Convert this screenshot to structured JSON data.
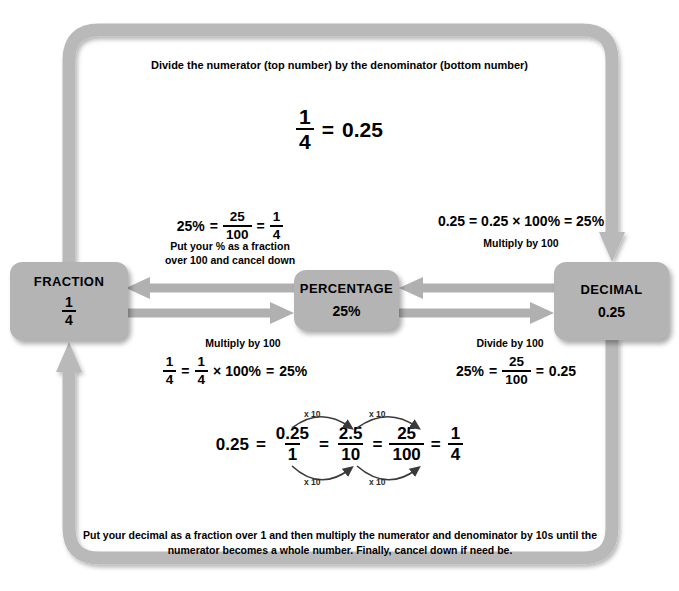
{
  "diagram": {
    "colors": {
      "node_fill": "#b4b4b4",
      "loop": "#b9b9b9",
      "arrow": "#b0b0b0",
      "text": "#000000"
    }
  },
  "top": {
    "caption": "Divide the numerator (top number) by the denominator (bottom number)",
    "equation": {
      "fraction": {
        "numerator": "1",
        "denominator": "4"
      },
      "equals": "=",
      "result": "0.25"
    }
  },
  "nodes": {
    "fraction": {
      "title": "FRACTION",
      "numerator": "1",
      "denominator": "4"
    },
    "percentage": {
      "title": "PERCENTAGE",
      "value": "25%"
    },
    "decimal": {
      "title": "DECIMAL",
      "value": "0.25"
    }
  },
  "percent_to_fraction": {
    "equation": {
      "left": "25%",
      "eq1": "=",
      "frac1": {
        "numerator": "25",
        "denominator": "100"
      },
      "eq2": "=",
      "frac2": {
        "numerator": "1",
        "denominator": "4"
      }
    },
    "caption": "Put your % as a fraction\nover 100 and cancel down"
  },
  "decimal_to_percent": {
    "equation": "0.25 = 0.25 × 100% = 25%",
    "caption": "Multiply by 100"
  },
  "fraction_to_percent": {
    "caption": "Multiply by 100",
    "equation": {
      "frac1": {
        "numerator": "1",
        "denominator": "4"
      },
      "eq1": "=",
      "frac2": {
        "numerator": "1",
        "denominator": "4"
      },
      "times": "× 100%",
      "eq2": "=",
      "result": "25%"
    }
  },
  "percent_to_decimal": {
    "caption": "Divide by 100",
    "equation": {
      "left": "25%",
      "eq1": "=",
      "frac1": {
        "numerator": "25",
        "denominator": "100"
      },
      "eq2": "=",
      "result": "0.25"
    }
  },
  "bottom": {
    "equation": {
      "start": "0.25",
      "eq1": "=",
      "frac1": {
        "numerator": "0.25",
        "denominator": "1"
      },
      "eq2": "=",
      "frac2": {
        "numerator": "2.5",
        "denominator": "10"
      },
      "eq3": "=",
      "frac3": {
        "numerator": "25",
        "denominator": "100"
      },
      "eq4": "=",
      "frac4": {
        "numerator": "1",
        "denominator": "4"
      }
    },
    "arrow_labels": {
      "top_left": "x 10",
      "top_right": "x 10",
      "bottom_left": "x 10",
      "bottom_right": "x 10"
    },
    "caption": "Put your decimal as a fraction over 1 and then multiply the numerator and denominator by 10s until the numerator becomes a whole number. Finally, cancel down if need be."
  }
}
